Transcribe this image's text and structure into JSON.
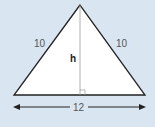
{
  "diagram": {
    "shape": "isosceles-triangle",
    "labels": {
      "left_side": "10",
      "right_side": "10",
      "height": "h",
      "base": "12"
    },
    "colors": {
      "background": "#d9e6f2",
      "fill": "#ffffff",
      "stroke": "#222222",
      "height_line": "#999999"
    }
  }
}
